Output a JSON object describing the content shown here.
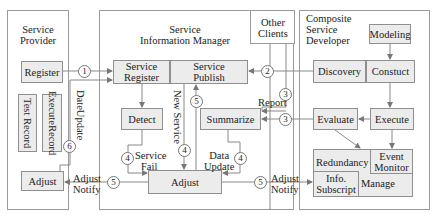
{
  "panels": {
    "service_provider": {
      "title_line1": "Service",
      "title_line2": "Provider"
    },
    "service_information_manager": {
      "title_line1": "Service",
      "title_line2": "Information Manager"
    },
    "other_clients": {
      "title_line1": "Other",
      "title_line2": "Clients"
    },
    "composite_service_developer": {
      "title_line1": "Composite",
      "title_line2": "Service",
      "title_line3": "Developer"
    }
  },
  "provider": {
    "register": "Register",
    "test_record": "Test Record",
    "execute_record_line1": "Execute",
    "execute_record_line2": "Record",
    "adjust": "Adjust"
  },
  "manager": {
    "service_register_line1": "Service",
    "service_register_line2": "Register",
    "service_publish_line1": "Service",
    "service_publish_line2": "Publish",
    "detect": "Detect",
    "summarize": "Summarize",
    "adjust": "Adjust"
  },
  "developer": {
    "modeling": "Modeling",
    "discovery": "Discovery",
    "construct": "Constuct",
    "evaluate": "Evaluate",
    "execute": "Execute",
    "redundancy": "Redundancy",
    "event_monitor_line1": "Event",
    "event_monitor_line2": "Monitor",
    "info_subscript_line1": "Info.",
    "info_subscript_line2": "Subscript",
    "manage": "Manage"
  },
  "edge_labels": {
    "date_update": "DateUpdate",
    "new_service": "New Service",
    "report": "Report",
    "service_fail_line1": "Service",
    "service_fail_line2": "Fail",
    "data_update_line1": "Data",
    "data_update_line2": "Update",
    "adjust_notify_left_line1": "Adjust",
    "adjust_notify_left_line2": "Notify",
    "adjust_notify_right_line1": "Adjust",
    "adjust_notify_right_line2": "Notify"
  },
  "step_numbers": {
    "register_to_manager": "1",
    "discovery_to_publish": "2",
    "clients_report": "3",
    "evaluate_report": "3",
    "service_fail": "4",
    "new_service": "4",
    "data_update": "4",
    "publish_feedback": "5",
    "adjust_notify_left": "5",
    "adjust_notify_right": "5",
    "date_update": "6"
  },
  "colors": {
    "box_fill": "#ececec",
    "border": "#8f8f8f",
    "arrow": "#777777"
  }
}
